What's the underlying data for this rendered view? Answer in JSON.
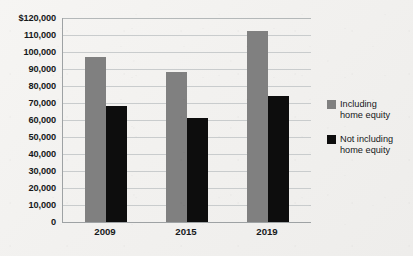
{
  "chart_data": {
    "type": "bar",
    "title": "",
    "subtitle": "",
    "xlabel": "",
    "ylabel": "",
    "categories": [
      "2009",
      "2015",
      "2019"
    ],
    "series": [
      {
        "name": "Including\nhome equity",
        "color": "#808080",
        "values": [
          97000,
          88000,
          112500
        ]
      },
      {
        "name": "Not including\nhome equity",
        "color": "#0d0d0d",
        "values": [
          68000,
          61000,
          74000
        ]
      }
    ],
    "ylim": [
      0,
      120000
    ],
    "ytick_values": [
      120000,
      110000,
      100000,
      90000,
      80000,
      70000,
      60000,
      50000,
      40000,
      30000,
      20000,
      10000,
      0
    ],
    "ytick_labels": [
      "$120,000",
      "110,000",
      "100,000",
      "90,000",
      "80,000",
      "70,000",
      "60,000",
      "50,000",
      "40,000",
      "30,000",
      "20,000",
      "10,000",
      "0"
    ],
    "grid": true,
    "legend_position": "right",
    "legend": [
      {
        "label": "Including\nhome equity",
        "color": "#808080"
      },
      {
        "label": "Not including\nhome equity",
        "color": "#0d0d0d"
      }
    ]
  },
  "colors": {
    "series_gray": "#808080",
    "series_black": "#0d0d0d",
    "gridline": "#c9cccd",
    "axis": "#9ea2a4",
    "text": "#16181a",
    "background": "#f3f2f0"
  }
}
